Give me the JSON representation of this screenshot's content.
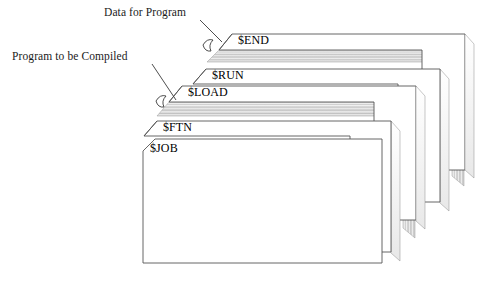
{
  "figure": {
    "background_color": "#ffffff",
    "line_color": "#555555",
    "deck_edge_color": "#b8b8b8",
    "text_color": "#1a1a1a"
  },
  "annotations": [
    {
      "id": "data-for-program",
      "label": "Data for Program",
      "text_x": 104,
      "text_y": 16,
      "line": "M 200,20 L 222,42",
      "hook": "M 206,44 q 5,-6 11,-3 q -6,6 -2,11 q -5,1 -9,-8 z"
    },
    {
      "id": "program-to-be-compiled",
      "label": "Program to be Compiled",
      "text_x": 12,
      "text_y": 60,
      "line": "M 152,64 L 176,100",
      "hook": "M 160,102 q 5,-6 11,-3 q -6,6 -2,11 q -5,1 -9,-8 z"
    }
  ],
  "decks": [
    {
      "id": "end",
      "label": "$END",
      "label_x": 238,
      "label_y": 44,
      "face": "M 232,34 L 465,34 L 465,170 L 422,170 L 422,50 L 219,50 Z",
      "top_edge": "M 219,50 L 232,34 L 465,34 L 452,50 Z",
      "side_edge": "M 465,34 L 474,44 L 474,176 L 465,170 Z",
      "deck_top": "M 207,62 L 219,50 L 452,50 L 440,62 Z",
      "deck_side": "M 452,50 L 464,62 L 464,186 L 452,176 Z",
      "stripes": 7
    },
    {
      "id": "run",
      "label": "$RUN",
      "label_x": 212,
      "label_y": 79,
      "face": "M 206,69 L 440,69 L 440,202 L 398,202 L 398,84 L 193,84 Z",
      "top_edge": "M 193,84 L 206,69 L 440,69 L 427,84 Z",
      "side_edge": "M 440,69 L 449,79 L 449,210 L 440,202 Z",
      "deck_top": null,
      "deck_side": null,
      "stripes": 0
    },
    {
      "id": "load",
      "label": "$LOAD",
      "label_x": 188,
      "label_y": 96,
      "face": "M 182,86 L 416,86 L 416,220 L 374,220 L 374,102 L 169,102 Z",
      "top_edge": "M 169,102 L 182,86 L 416,86 L 403,102 Z",
      "side_edge": "M 416,86 L 425,96 L 425,228 L 416,220 Z",
      "deck_top": "M 157,116 L 169,102 L 403,102 L 391,116 Z",
      "deck_side": "M 403,102 L 415,116 L 415,238 L 403,228 Z",
      "stripes": 7
    },
    {
      "id": "ftn",
      "label": "$FTN",
      "label_x": 163,
      "label_y": 131,
      "face": "M 157,121 L 391,121 L 391,252 L 350,252 L 350,136 L 144,136 Z",
      "top_edge": "M 144,136 L 157,121 L 391,121 L 378,136 Z",
      "side_edge": "M 391,121 L 400,131 L 400,260 L 391,252 Z",
      "deck_top": null,
      "deck_side": null,
      "stripes": 0
    },
    {
      "id": "job",
      "label": "$JOB",
      "label_x": 150,
      "label_y": 152,
      "face": "M 155,139 L 382,139 L 382,263 L 143,263 L 143,151 Z",
      "top_edge": null,
      "side_edge": null,
      "deck_top": null,
      "deck_side": null,
      "stripes": 0
    }
  ]
}
